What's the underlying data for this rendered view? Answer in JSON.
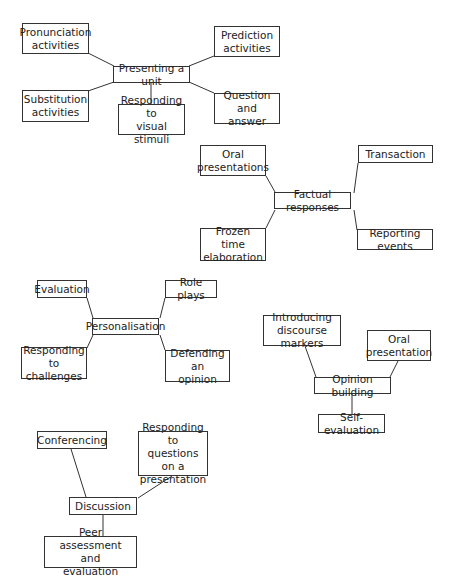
{
  "diagram": {
    "clusters": [
      {
        "center": {
          "label": "Presenting a unit",
          "box": [
            113,
            66,
            77,
            17
          ]
        },
        "branches": [
          {
            "label": "Pronunciation\nactivities",
            "box": [
              22,
              23,
              67,
              31
            ],
            "line": [
              88,
              53,
              114,
              66
            ]
          },
          {
            "label": "Prediction\nactivities",
            "box": [
              214,
              26,
              66,
              31
            ],
            "line": [
              214,
              56,
              189,
              66
            ]
          },
          {
            "label": "Substitution\nactivities",
            "box": [
              22,
              90,
              67,
              32
            ],
            "line": [
              88,
              91,
              114,
              82
            ]
          },
          {
            "label": "Responding to\nvisual stimuli",
            "box": [
              118,
              104,
              67,
              31
            ],
            "line": [
              151,
              83,
              151,
              104
            ]
          },
          {
            "label": "Question and\nanswer",
            "box": [
              214,
              93,
              66,
              31
            ],
            "line": [
              214,
              93,
              189,
              82
            ]
          }
        ]
      },
      {
        "center": {
          "label": "Factual responses",
          "box": [
            274,
            192,
            77,
            17
          ]
        },
        "branches": [
          {
            "label": "Oral\npresentations",
            "box": [
              200,
              145,
              66,
              31
            ],
            "line": [
              266,
              176,
              275,
              192
            ]
          },
          {
            "label": "Transaction",
            "box": [
              358,
              145,
              75,
              18
            ],
            "line": [
              358,
              163,
              354,
              193
            ]
          },
          {
            "label": "Frozen time\nelaboration",
            "box": [
              200,
              228,
              66,
              33
            ],
            "line": [
              266,
              228,
              275,
              210
            ]
          },
          {
            "label": "Reporting events",
            "box": [
              357,
              229,
              76,
              21
            ],
            "line": [
              357,
              230,
              354,
              210
            ]
          }
        ]
      },
      {
        "center": {
          "label": "Personalisation",
          "box": [
            92,
            318,
            67,
            17
          ]
        },
        "branches": [
          {
            "label": "Evaluation",
            "box": [
              37,
              280,
              50,
              18
            ],
            "line": [
              87,
              298,
              93,
              318
            ]
          },
          {
            "label": "Role plays",
            "box": [
              165,
              280,
              52,
              18
            ],
            "line": [
              165,
              298,
              160,
              318
            ]
          },
          {
            "label": "Responding to\nchallenges",
            "box": [
              21,
              347,
              66,
              32
            ],
            "line": [
              87,
              348,
              93,
              335
            ]
          },
          {
            "label": "Defending an\nopinion",
            "box": [
              165,
              350,
              65,
              32
            ],
            "line": [
              165,
              350,
              160,
              335
            ]
          }
        ]
      },
      {
        "center": {
          "label": "Opinion building",
          "box": [
            314,
            377,
            77,
            17
          ]
        },
        "branches": [
          {
            "label": "Introducing\ndiscourse markers",
            "box": [
              263,
              315,
              78,
              31
            ],
            "line": [
              305,
              346,
              316,
              377
            ]
          },
          {
            "label": "Oral\npresentation",
            "box": [
              367,
              330,
              64,
              31
            ],
            "line": [
              398,
              361,
              390,
              377
            ]
          },
          {
            "label": "Self-evaluation",
            "box": [
              318,
              414,
              67,
              19
            ],
            "line": [
              352,
              394,
              352,
              414
            ]
          }
        ]
      },
      {
        "center": {
          "label": "Discussion",
          "box": [
            69,
            497,
            68,
            18
          ]
        },
        "branches": [
          {
            "label": "Conferencing",
            "box": [
              37,
              431,
              70,
              18
            ],
            "line": [
              71,
              449,
              86,
              497
            ]
          },
          {
            "label": "Responding to\nquestions on a\npresentation",
            "box": [
              138,
              431,
              70,
              45
            ],
            "line": [
              172,
              476,
              138,
              498
            ]
          },
          {
            "label": "Peer assessment and\nevaluation",
            "box": [
              44,
              536,
              93,
              32
            ],
            "line": [
              103,
              515,
              103,
              536
            ]
          }
        ]
      }
    ]
  }
}
